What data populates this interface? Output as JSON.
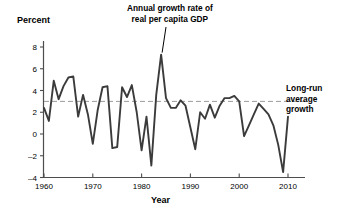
{
  "chart_data": {
    "type": "line",
    "title": "",
    "xlabel": "Year",
    "ylabel": "Percent",
    "xlim": [
      1959,
      2011
    ],
    "ylim": [
      -4,
      9
    ],
    "grid": false,
    "legend": "none",
    "y_ticks": [
      8,
      6,
      4,
      2,
      0,
      -2,
      -4
    ],
    "y_tick_labels": [
      "8",
      "6",
      "4",
      "2",
      "0",
      "-2",
      "-4"
    ],
    "x_ticks": [
      1960,
      1970,
      1980,
      1990,
      2000,
      2010
    ],
    "x_tick_labels": [
      "1960",
      "1970",
      "1980",
      "1990",
      "2000",
      "2010"
    ],
    "series": [
      {
        "name": "Annual growth rate of real per capita GDP",
        "color": "#3b3b3b",
        "x": [
          1960,
          1961,
          1962,
          1963,
          1964,
          1965,
          1966,
          1967,
          1968,
          1969,
          1970,
          1971,
          1972,
          1973,
          1974,
          1975,
          1976,
          1977,
          1978,
          1979,
          1980,
          1981,
          1982,
          1983,
          1984,
          1985,
          1986,
          1987,
          1988,
          1989,
          1990,
          1991,
          1992,
          1993,
          1994,
          1995,
          1996,
          1997,
          1998,
          1999,
          2000,
          2001,
          2002,
          2003,
          2004,
          2005,
          2006,
          2007,
          2008,
          2009,
          2010
        ],
        "values": [
          2.4,
          1.2,
          4.9,
          3.2,
          4.4,
          5.2,
          5.3,
          1.6,
          3.6,
          1.8,
          -0.9,
          2.2,
          4.3,
          4.4,
          -1.3,
          -1.2,
          4.3,
          3.4,
          4.5,
          2.0,
          -1.5,
          1.6,
          -2.9,
          3.6,
          7.3,
          3.3,
          2.4,
          2.4,
          3.1,
          2.6,
          0.6,
          -1.4,
          2.0,
          1.4,
          2.7,
          1.5,
          2.6,
          3.3,
          3.3,
          3.5,
          3.0,
          -0.2,
          0.8,
          1.8,
          2.8,
          2.3,
          1.8,
          0.8,
          -1.0,
          -3.5,
          1.6
        ]
      }
    ],
    "reference_line": {
      "name": "Long-run average growth",
      "value": 3.0,
      "style": "dashed",
      "color": "#9a9a9a"
    },
    "annotations": [
      {
        "name": "series-callout",
        "lines": [
          "Annual growth rate of",
          "real per capita GDP"
        ],
        "points_to_year": 1984
      },
      {
        "name": "reference-callout",
        "lines": [
          "Long-run",
          "average",
          "growth"
        ]
      }
    ]
  },
  "labels": {
    "y_axis_title": "Percent",
    "x_axis_title": "Year"
  },
  "annotation_growth": {
    "line1": "Annual growth rate of",
    "line2": "real per capita GDP"
  },
  "annotation_longrun": {
    "line1": "Long-run",
    "line2": "average",
    "line3": "growth"
  },
  "colors": {
    "line": "#3b3b3b",
    "axis": "#4d4d4d",
    "dashed": "#9a9a9a",
    "text": "#000000",
    "background": "#ffffff"
  }
}
